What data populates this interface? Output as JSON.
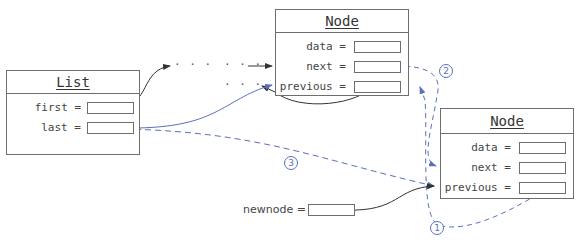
{
  "list": {
    "title": "List",
    "fields": [
      {
        "label": "first =",
        "value": ""
      },
      {
        "label": "last =",
        "value": ""
      }
    ]
  },
  "node_top": {
    "title": "Node",
    "fields": [
      {
        "label": "data =",
        "value": ""
      },
      {
        "label": "next =",
        "value": ""
      },
      {
        "label": "previous =",
        "value": ""
      }
    ]
  },
  "node_new": {
    "title": "Node",
    "fields": [
      {
        "label": "data =",
        "value": ""
      },
      {
        "label": "next =",
        "value": ""
      },
      {
        "label": "previous =",
        "value": ""
      }
    ]
  },
  "newnode": {
    "label": "newnode =",
    "value": ""
  },
  "ellipses": [
    "· · ·",
    "· · ·",
    "· · ·"
  ],
  "steps": [
    "1",
    "2",
    "3"
  ],
  "colors": {
    "box_border": "#6e6e6e",
    "arrow_black": "#333333",
    "arrow_blue": "#5a6fc0"
  }
}
